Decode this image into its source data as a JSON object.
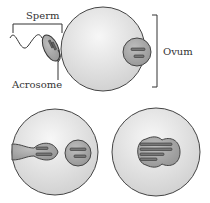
{
  "labels": {
    "sperm": "Sperm",
    "acrosome": "Acrosome",
    "ovum": "Ovum"
  },
  "panels": [
    {
      "id": "sperm-contact",
      "description": "Sperm acrosome contacting ovum surface"
    },
    {
      "id": "sperm-entry",
      "description": "Sperm nucleus inside ovum next to ovum nucleus"
    },
    {
      "id": "fusion",
      "description": "Fused nuclei with combined chromosomes"
    }
  ],
  "colors": {
    "cell_fill": "#e4e4e4",
    "nucleus_fill": "#a9a9a9",
    "outline": "#333333"
  }
}
